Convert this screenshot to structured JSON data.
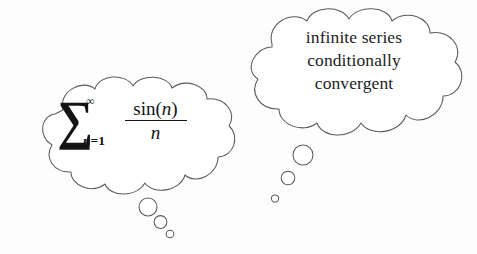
{
  "canvas": {
    "width": 477,
    "height": 254,
    "background_color": "#fdfdfd",
    "stroke_color": "#5a5a5e",
    "text_color": "#1d1d1f"
  },
  "left_bubble": {
    "name": "formula-thought-bubble",
    "formula": {
      "operator": "∑",
      "upper_limit": "∞",
      "lower_limit_variable": "n",
      "lower_limit_equals": "=1",
      "numerator_function": "sin(",
      "numerator_variable": "n",
      "numerator_close": ")",
      "denominator": "n",
      "plain_text": "∑ from n=1 to ∞ of sin(n)/n"
    },
    "trail_circles": [
      {
        "cx": 148,
        "cy": 207,
        "r": 9
      },
      {
        "cx": 160.5,
        "cy": 222,
        "r": 6.4
      },
      {
        "cx": 170,
        "cy": 234,
        "r": 3.8
      }
    ]
  },
  "right_bubble": {
    "name": "description-thought-bubble",
    "lines": [
      "infinite series",
      "conditionally",
      "convergent"
    ],
    "trail_circles": [
      {
        "cx": 303,
        "cy": 155,
        "r": 10
      },
      {
        "cx": 288,
        "cy": 178,
        "r": 6.8
      },
      {
        "cx": 275,
        "cy": 198.5,
        "r": 3.6
      }
    ]
  }
}
